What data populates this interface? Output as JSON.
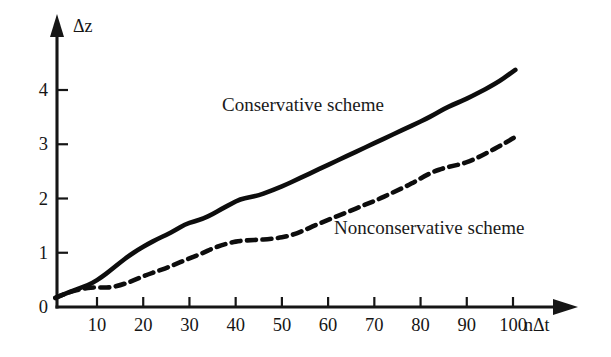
{
  "chart_data": {
    "type": "line",
    "title": "",
    "subtitle": "",
    "xlabel": "nΔt",
    "ylabel": "Δz",
    "xlim": [
      0,
      110
    ],
    "ylim": [
      0,
      4.9
    ],
    "grid": false,
    "legend_position": "inline-annotations",
    "x_ticks": [
      10,
      20,
      30,
      40,
      50,
      60,
      70,
      80,
      90,
      100
    ],
    "x_tick_labels": [
      "10",
      "20",
      "30",
      "40",
      "50",
      "60",
      "70",
      "80",
      "90",
      "100"
    ],
    "y_ticks": [
      0,
      1,
      2,
      3,
      4
    ],
    "y_tick_labels": [
      "0",
      "1",
      "2",
      "3",
      "4"
    ],
    "annotations": [
      {
        "name": "conservative-scheme-label",
        "text": "Conservative scheme",
        "x_px": 222,
        "y_px": 95
      },
      {
        "name": "nonconservative-scheme-label",
        "text": "Nonconservative scheme",
        "x_px": 334,
        "y_px": 218
      }
    ],
    "series": [
      {
        "name": "Conservative scheme",
        "style": "solid",
        "color": "#0d0d0d",
        "x": [
          1,
          3,
          5,
          7,
          9,
          11,
          13,
          15,
          17,
          19,
          21,
          23,
          25,
          27,
          29,
          31,
          33,
          35,
          37,
          39,
          41,
          43,
          45,
          47,
          49,
          51,
          53,
          55,
          57,
          59,
          61,
          63,
          65,
          67,
          69,
          71,
          73,
          75,
          77,
          79,
          81,
          83,
          85,
          87,
          89,
          91,
          93,
          95,
          97,
          99,
          100.5
        ],
        "y": [
          0.17,
          0.24,
          0.31,
          0.37,
          0.44,
          0.55,
          0.68,
          0.82,
          0.95,
          1.06,
          1.16,
          1.25,
          1.33,
          1.42,
          1.52,
          1.58,
          1.63,
          1.71,
          1.81,
          1.9,
          1.99,
          2.02,
          2.06,
          2.12,
          2.19,
          2.26,
          2.34,
          2.42,
          2.5,
          2.58,
          2.66,
          2.74,
          2.82,
          2.9,
          2.98,
          3.06,
          3.14,
          3.22,
          3.3,
          3.38,
          3.46,
          3.55,
          3.65,
          3.73,
          3.8,
          3.88,
          3.97,
          4.06,
          4.16,
          4.28,
          4.37
        ]
      },
      {
        "name": "Nonconservative scheme",
        "style": "dashed",
        "color": "#0d0d0d",
        "x": [
          1,
          3,
          5,
          7,
          9,
          11,
          13,
          15,
          17,
          19,
          21,
          23,
          25,
          27,
          29,
          31,
          33,
          35,
          37,
          39,
          41,
          43,
          45,
          47,
          49,
          51,
          53,
          55,
          57,
          59,
          61,
          63,
          65,
          67,
          69,
          71,
          73,
          75,
          77,
          79,
          81,
          83,
          85,
          87,
          89,
          91,
          93,
          95,
          97,
          99,
          101
        ],
        "y": [
          0.17,
          0.24,
          0.3,
          0.34,
          0.36,
          0.36,
          0.36,
          0.4,
          0.46,
          0.53,
          0.6,
          0.66,
          0.72,
          0.79,
          0.86,
          0.93,
          1.0,
          1.08,
          1.14,
          1.19,
          1.22,
          1.23,
          1.24,
          1.25,
          1.27,
          1.3,
          1.35,
          1.42,
          1.5,
          1.57,
          1.64,
          1.71,
          1.78,
          1.85,
          1.92,
          1.99,
          2.07,
          2.15,
          2.23,
          2.32,
          2.42,
          2.5,
          2.56,
          2.6,
          2.64,
          2.7,
          2.78,
          2.87,
          2.96,
          3.06,
          3.16
        ]
      }
    ]
  },
  "axis": {
    "y_arrow_label": "Δz",
    "x_arrow_label": "nΔt"
  },
  "colors": {
    "ink": "#0d0d0d",
    "background": "#ffffff"
  }
}
